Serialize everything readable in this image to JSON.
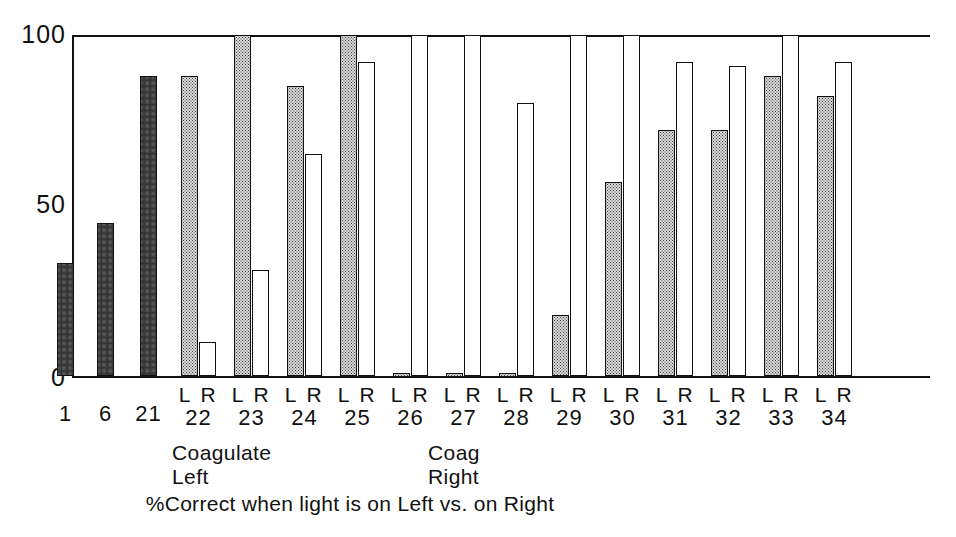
{
  "caption": "%Correct when light is on Left vs. on Right",
  "axis": {
    "y_ticks": [
      "100",
      "50",
      "0"
    ],
    "y_values": [
      100,
      50,
      0
    ]
  },
  "annotations": [
    {
      "id": "coag-left",
      "text": "Coagulate\nLeft"
    },
    {
      "id": "coag-right",
      "text": "Coag\nRight"
    }
  ],
  "pair_label": {
    "left": "L",
    "right": "R"
  },
  "chart_data": {
    "type": "bar",
    "title": "",
    "subtitle": "",
    "xlabel": "%Correct when light is on Left vs. on Right",
    "ylabel": "",
    "ylim": [
      0,
      100
    ],
    "yticks": [
      0,
      50,
      100
    ],
    "grid": false,
    "legend": [
      {
        "name": "Light on Left",
        "fill": "stippled-gray"
      },
      {
        "name": "Light on Right",
        "fill": "white"
      }
    ],
    "categories": [
      "1",
      "6",
      "21",
      "22",
      "23",
      "24",
      "25",
      "26",
      "27",
      "28",
      "29",
      "30",
      "31",
      "32",
      "33",
      "34"
    ],
    "series": [
      {
        "name": "Light on Left",
        "values": [
          33,
          45,
          88,
          88,
          100,
          85,
          100,
          1,
          1,
          1,
          18,
          57,
          72,
          72,
          88,
          82
        ]
      },
      {
        "name": "Light on Right",
        "values": [
          null,
          null,
          null,
          10,
          31,
          65,
          92,
          100,
          100,
          80,
          100,
          100,
          92,
          91,
          100,
          92
        ]
      }
    ],
    "groups": [
      {
        "label": "1",
        "single": true,
        "left": 33,
        "right": null
      },
      {
        "label": "6",
        "single": true,
        "left": 45,
        "right": null
      },
      {
        "label": "21",
        "single": true,
        "left": 88,
        "right": null
      },
      {
        "label": "22",
        "single": false,
        "left": 88,
        "right": 10
      },
      {
        "label": "23",
        "single": false,
        "left": 100,
        "right": 31
      },
      {
        "label": "24",
        "single": false,
        "left": 85,
        "right": 65
      },
      {
        "label": "25",
        "single": false,
        "left": 100,
        "right": 92
      },
      {
        "label": "26",
        "single": false,
        "left": 1,
        "right": 100
      },
      {
        "label": "27",
        "single": false,
        "left": 1,
        "right": 100
      },
      {
        "label": "28",
        "single": false,
        "left": 1,
        "right": 80
      },
      {
        "label": "29",
        "single": false,
        "left": 18,
        "right": 100
      },
      {
        "label": "30",
        "single": false,
        "left": 57,
        "right": 100
      },
      {
        "label": "31",
        "single": false,
        "left": 72,
        "right": 92
      },
      {
        "label": "32",
        "single": false,
        "left": 72,
        "right": 91
      },
      {
        "label": "33",
        "single": false,
        "left": 88,
        "right": 100
      },
      {
        "label": "34",
        "single": false,
        "left": 82,
        "right": 92
      }
    ]
  },
  "colors": {
    "axis": "#111111",
    "bar_left_fill": "#d8d8d8",
    "bar_right_fill": "#ffffff",
    "text": "#111111"
  }
}
